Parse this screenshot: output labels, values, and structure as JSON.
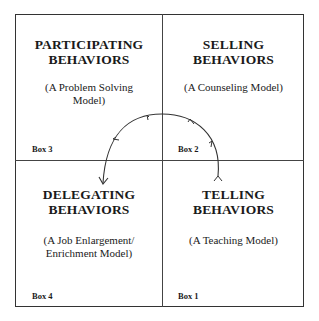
{
  "diagram": {
    "type": "quadrant-model",
    "quadrants": [
      {
        "position": "top-left",
        "box": "Box 3",
        "title_line1": "PARTICIPATING",
        "title_line2": "BEHAVIORS",
        "subtitle_line1": "(A Problem Solving",
        "subtitle_line2": "Model)"
      },
      {
        "position": "top-right",
        "box": "Box 2",
        "title_line1": "SELLING",
        "title_line2": "BEHAVIORS",
        "subtitle_line1": "(A Counseling Model)",
        "subtitle_line2": ""
      },
      {
        "position": "bottom-left",
        "box": "Box 4",
        "title_line1": "DELEGATING",
        "title_line2": "BEHAVIORS",
        "subtitle_line1": "(A Job Enlargement/",
        "subtitle_line2": "Enrichment Model)"
      },
      {
        "position": "bottom-right",
        "box": "Box 1",
        "title_line1": "TELLING",
        "title_line2": "BEHAVIORS",
        "subtitle_line1": "(A Teaching Model)",
        "subtitle_line2": ""
      }
    ],
    "arc": {
      "direction": "counter-clockwise",
      "sequence": [
        "Box 1",
        "Box 2",
        "Box 3",
        "Box 4"
      ],
      "color": "#333333"
    }
  }
}
